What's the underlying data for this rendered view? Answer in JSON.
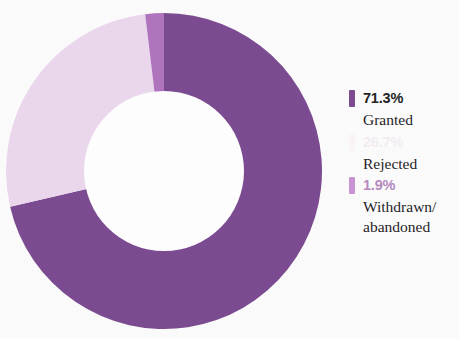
{
  "chart_data": {
    "type": "pie",
    "variant": "donut",
    "title": "",
    "subtitle": "",
    "xlabel": "",
    "ylabel": "",
    "legend_position": "right",
    "grid": false,
    "hole_ratio": 0.5,
    "start_angle_deg": 0,
    "direction": "clockwise",
    "units": "percent",
    "categories": [
      "Granted",
      "Rejected",
      "Withdrawn/abandoned"
    ],
    "values": [
      71.3,
      26.7,
      1.9
    ],
    "labels": [
      "71.3%",
      "26.7%",
      "1.9%"
    ],
    "colors": [
      "#7b4a91",
      "#ecd8ee",
      "#b073bd"
    ],
    "slices": [
      {
        "label": "Granted",
        "value": 71.3,
        "display": "71.3%",
        "color": "#7b4a91"
      },
      {
        "label": "Rejected",
        "value": 26.7,
        "display": "26.7%",
        "color": "#ecd8ee"
      },
      {
        "label": "Withdrawn/abandoned",
        "value": 1.9,
        "display": "1.9%",
        "color": "#b073bd"
      }
    ]
  },
  "legend": {
    "entries": [
      {
        "percent": "71.3%",
        "label": "Granted",
        "swatch_color": "#7b4a91",
        "percent_color": "#221f22"
      },
      {
        "percent": "26.7%",
        "label": "Rejected",
        "swatch_color": "#ecd8ee",
        "percent_color": "#c9a8cd"
      },
      {
        "percent": "1.9%",
        "label": "Withdrawn/\nabandoned",
        "swatch_color": "#c894d2",
        "percent_color": "#b589c0"
      }
    ]
  },
  "colors": {
    "granted": "#7b4a91",
    "rejected": "#ecd8ee",
    "withdrawn": "#b073bd",
    "background": "#fdfcfc",
    "text": "#1d1d1f"
  }
}
